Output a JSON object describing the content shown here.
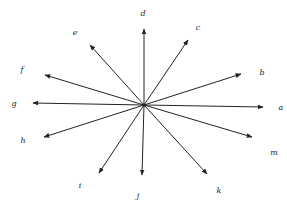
{
  "diagram": {
    "type": "radial vectors from a common origin",
    "origin": [
      144,
      105
    ],
    "arrow_color": "#222222",
    "vectors": [
      {
        "label": "a",
        "tip": [
          263,
          107
        ],
        "label_pos": [
          281,
          108
        ]
      },
      {
        "label": "b",
        "tip": [
          241,
          74
        ],
        "label_pos": [
          262,
          73
        ]
      },
      {
        "label": "c",
        "tip": [
          188,
          40
        ],
        "label_pos": [
          198,
          28
        ]
      },
      {
        "label": "d",
        "tip": [
          144,
          29
        ],
        "label_pos": [
          143,
          14
        ]
      },
      {
        "label": "e",
        "tip": [
          90,
          45
        ],
        "label_pos": [
          75,
          33
        ]
      },
      {
        "label": "f",
        "tip": [
          45,
          75
        ],
        "label_pos": [
          22,
          70
        ]
      },
      {
        "label": "g",
        "tip": [
          33,
          103
        ],
        "label_pos": [
          14,
          104
        ]
      },
      {
        "label": "h",
        "tip": [
          44,
          137
        ],
        "label_pos": [
          23,
          141
        ]
      },
      {
        "label": "i",
        "tip": [
          99,
          173
        ],
        "label_pos": [
          80,
          186
        ]
      },
      {
        "label": "j",
        "tip": [
          142,
          175
        ],
        "label_pos": [
          138,
          196
        ]
      },
      {
        "label": "k",
        "tip": [
          207,
          174
        ],
        "label_pos": [
          219,
          191
        ]
      },
      {
        "label": "m",
        "tip": [
          252,
          137
        ],
        "label_pos": [
          274,
          153
        ]
      }
    ]
  }
}
